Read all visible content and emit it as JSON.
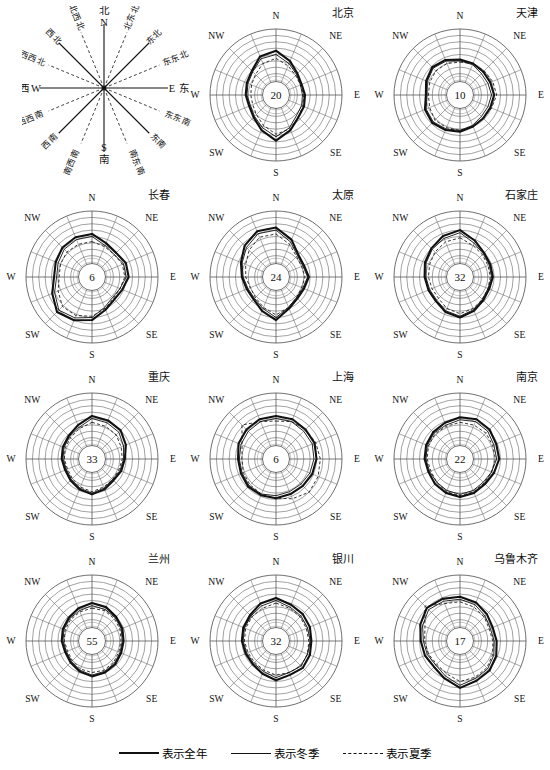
{
  "compass_key": {
    "name": "wind-direction-compass-key",
    "cardinals": [
      {
        "id": "N",
        "latin": "N",
        "cn": "北"
      },
      {
        "id": "E",
        "latin": "E",
        "cn": "东"
      },
      {
        "id": "S",
        "latin": "S",
        "cn": "南"
      },
      {
        "id": "W",
        "latin": "W",
        "cn": "西"
      }
    ],
    "intercardinals": [
      {
        "id": "NNE",
        "cn": "北东北",
        "angle": 22.5
      },
      {
        "id": "NE",
        "cn": "东北",
        "angle": 45
      },
      {
        "id": "ENE",
        "cn": "东东北",
        "angle": 67.5
      },
      {
        "id": "ESE",
        "cn": "东东南",
        "angle": 112.5
      },
      {
        "id": "SE",
        "cn": "东南",
        "angle": 135
      },
      {
        "id": "SSE",
        "cn": "南东南",
        "angle": 157.5
      },
      {
        "id": "SSW",
        "cn": "南西南",
        "angle": 202.5
      },
      {
        "id": "SW",
        "cn": "西南",
        "angle": 225
      },
      {
        "id": "WSW",
        "cn": "西西南",
        "angle": 247.5
      },
      {
        "id": "WNW",
        "cn": "西西北",
        "angle": 292.5
      },
      {
        "id": "NW",
        "cn": "西北",
        "angle": 315
      },
      {
        "id": "NNW",
        "cn": "北西北",
        "angle": 337.5
      }
    ]
  },
  "legend": {
    "items": [
      {
        "id": "annual",
        "style": "thick-solid",
        "label": "表示全年"
      },
      {
        "id": "winter",
        "style": "thin-solid",
        "label": "表示冬季"
      },
      {
        "id": "summer",
        "style": "dashed",
        "label": "表示夏季"
      }
    ]
  },
  "axis_labels": {
    "n": "N",
    "ne": "NE",
    "e": "E",
    "se": "SE",
    "s": "S",
    "sw": "SW",
    "w": "W",
    "nw": "NW"
  },
  "chart_data": {
    "type": "line",
    "subtype": "wind-rose (polar radar), 16 compass sectors",
    "grid": true,
    "rings": 8,
    "sectors": 16,
    "directions": [
      "N",
      "NNE",
      "NE",
      "ENE",
      "E",
      "ESE",
      "SE",
      "SSE",
      "S",
      "SSW",
      "SW",
      "WSW",
      "W",
      "WNW",
      "NW",
      "NNW"
    ],
    "series_legend": [
      {
        "name": "表示全年",
        "style": "thick-solid"
      },
      {
        "name": "表示冬季",
        "style": "thin-solid"
      },
      {
        "name": "表示夏季",
        "style": "dashed"
      }
    ],
    "center_label_meaning": "中心数字为全年静风频率 (%)",
    "rlim": [
      0,
      8
    ],
    "charts": [
      {
        "city_cn": "北京",
        "center_value": "20",
        "series": [
          {
            "name": "表示全年",
            "style": "thick-solid",
            "values": [
              4.6,
              3.4,
              2.4,
              2.0,
              2.2,
              2.4,
              2.6,
              3.6,
              4.8,
              3.6,
              2.6,
              2.2,
              2.4,
              2.6,
              3.0,
              4.2
            ]
          },
          {
            "name": "表示冬季",
            "style": "thin-solid",
            "values": [
              4.0,
              3.0,
              2.2,
              1.8,
              1.8,
              2.0,
              2.2,
              3.2,
              4.2,
              3.2,
              2.4,
              2.0,
              2.2,
              2.4,
              2.8,
              3.8
            ]
          },
          {
            "name": "表示夏季",
            "style": "dashed",
            "values": [
              3.4,
              2.6,
              2.0,
              1.8,
              2.0,
              2.2,
              2.6,
              3.4,
              3.8,
              2.8,
              2.0,
              1.6,
              1.6,
              1.8,
              2.2,
              3.0
            ]
          }
        ]
      },
      {
        "city_cn": "天津",
        "center_value": "10",
        "series": [
          {
            "name": "表示全年",
            "style": "thick-solid",
            "values": [
              3.2,
              3.0,
              2.8,
              2.8,
              3.0,
              2.8,
              2.8,
              3.0,
              3.4,
              3.6,
              3.8,
              3.6,
              3.0,
              3.4,
              3.8,
              3.6
            ]
          },
          {
            "name": "表示冬季",
            "style": "thin-solid",
            "values": [
              3.0,
              2.8,
              2.4,
              2.4,
              2.6,
              2.4,
              2.4,
              2.8,
              3.2,
              3.4,
              3.6,
              3.4,
              2.8,
              3.2,
              3.6,
              3.4
            ]
          },
          {
            "name": "表示夏季",
            "style": "dashed",
            "values": [
              2.8,
              3.0,
              3.0,
              3.2,
              3.4,
              3.0,
              2.8,
              3.0,
              3.2,
              3.2,
              3.2,
              2.8,
              2.6,
              2.8,
              3.0,
              3.0
            ]
          }
        ]
      },
      {
        "city_cn": "长春",
        "center_value": "6",
        "series": [
          {
            "name": "表示全年",
            "style": "thick-solid",
            "values": [
              4.4,
              3.4,
              3.0,
              3.4,
              3.4,
              2.8,
              2.6,
              3.2,
              4.4,
              5.0,
              5.4,
              4.4,
              3.6,
              3.8,
              4.2,
              4.4
            ]
          },
          {
            "name": "表示冬季",
            "style": "thin-solid",
            "values": [
              4.0,
              3.0,
              2.6,
              3.0,
              3.0,
              2.4,
              2.2,
              2.8,
              4.0,
              4.6,
              5.0,
              4.0,
              3.2,
              3.4,
              3.8,
              4.0
            ]
          },
          {
            "name": "表示夏季",
            "style": "dashed",
            "values": [
              3.2,
              2.8,
              2.6,
              2.8,
              2.8,
              2.4,
              2.4,
              3.0,
              3.8,
              4.2,
              4.2,
              3.4,
              2.8,
              3.0,
              3.2,
              3.2
            ]
          }
        ]
      },
      {
        "city_cn": "太原",
        "center_value": "24",
        "series": [
          {
            "name": "表示全年",
            "style": "thick-solid",
            "values": [
              5.4,
              4.0,
              2.6,
              2.4,
              2.8,
              2.4,
              2.4,
              3.0,
              4.4,
              3.4,
              2.6,
              2.6,
              3.0,
              3.6,
              4.6,
              5.4
            ]
          },
          {
            "name": "表示冬季",
            "style": "thin-solid",
            "values": [
              5.0,
              3.6,
              2.4,
              2.2,
              2.6,
              2.2,
              2.2,
              2.8,
              4.0,
              3.0,
              2.4,
              2.4,
              2.8,
              3.4,
              4.2,
              5.0
            ]
          },
          {
            "name": "表示夏季",
            "style": "dashed",
            "values": [
              4.4,
              3.2,
              2.2,
              2.0,
              2.2,
              2.0,
              2.2,
              2.8,
              3.6,
              2.8,
              2.2,
              2.0,
              2.4,
              2.8,
              3.6,
              4.4
            ]
          }
        ]
      },
      {
        "city_cn": "石家庄",
        "center_value": "32",
        "series": [
          {
            "name": "表示全年",
            "style": "thick-solid",
            "values": [
              5.0,
              3.8,
              3.0,
              2.8,
              2.8,
              2.6,
              2.8,
              3.4,
              4.0,
              3.6,
              3.0,
              3.0,
              3.2,
              3.6,
              4.0,
              4.6
            ]
          },
          {
            "name": "表示冬季",
            "style": "thin-solid",
            "values": [
              4.6,
              3.4,
              2.8,
              2.6,
              2.6,
              2.4,
              2.6,
              3.2,
              3.8,
              3.4,
              2.8,
              2.8,
              3.0,
              3.4,
              3.8,
              4.2
            ]
          },
          {
            "name": "表示夏季",
            "style": "dashed",
            "values": [
              3.8,
              3.0,
              2.6,
              2.4,
              2.4,
              2.4,
              2.6,
              3.0,
              3.4,
              3.0,
              2.4,
              2.4,
              2.6,
              2.8,
              3.2,
              3.6
            ]
          }
        ]
      },
      {
        "city_cn": "重庆",
        "center_value": "33",
        "series": [
          {
            "name": "表示全年",
            "style": "thick-solid",
            "values": [
              4.4,
              4.2,
              4.0,
              3.4,
              2.8,
              2.6,
              2.4,
              2.8,
              3.2,
              2.8,
              2.4,
              2.2,
              2.4,
              2.6,
              2.8,
              3.4
            ]
          },
          {
            "name": "表示冬季",
            "style": "thin-solid",
            "values": [
              4.0,
              3.8,
              3.6,
              3.0,
              2.6,
              2.4,
              2.2,
              2.6,
              3.0,
              2.6,
              2.2,
              2.0,
              2.2,
              2.4,
              2.6,
              3.0
            ]
          },
          {
            "name": "表示夏季",
            "style": "dashed",
            "values": [
              3.4,
              3.2,
              3.0,
              2.6,
              2.4,
              2.2,
              2.2,
              2.4,
              2.8,
              2.4,
              2.0,
              1.8,
              2.0,
              2.2,
              2.4,
              2.8
            ]
          }
        ]
      },
      {
        "city_cn": "上海",
        "center_value": "6",
        "series": [
          {
            "name": "表示全年",
            "style": "thick-solid",
            "values": [
              4.4,
              4.4,
              4.2,
              4.2,
              4.0,
              3.8,
              3.6,
              3.6,
              3.8,
              3.8,
              3.8,
              3.6,
              3.6,
              4.0,
              4.2,
              4.4
            ]
          },
          {
            "name": "表示冬季",
            "style": "thin-solid",
            "values": [
              4.0,
              4.0,
              3.8,
              3.8,
              3.6,
              3.4,
              3.2,
              3.2,
              3.4,
              3.6,
              3.6,
              3.4,
              3.4,
              3.6,
              3.8,
              4.0
            ]
          },
          {
            "name": "表示夏季",
            "style": "dashed",
            "values": [
              3.6,
              4.0,
              4.2,
              4.4,
              4.6,
              4.8,
              5.0,
              4.4,
              3.8,
              3.6,
              3.4,
              3.2,
              3.0,
              3.4,
              5.2,
              4.0
            ]
          }
        ]
      },
      {
        "city_cn": "南京",
        "center_value": "22",
        "series": [
          {
            "name": "表示全年",
            "style": "thick-solid",
            "values": [
              4.2,
              4.4,
              4.2,
              3.8,
              3.8,
              3.4,
              3.2,
              3.4,
              3.6,
              3.4,
              3.2,
              3.0,
              3.2,
              3.4,
              3.6,
              3.8
            ]
          },
          {
            "name": "表示冬季",
            "style": "thin-solid",
            "values": [
              3.8,
              4.0,
              3.8,
              3.4,
              3.4,
              3.0,
              2.8,
              3.0,
              3.2,
              3.0,
              2.8,
              2.8,
              3.0,
              3.2,
              3.4,
              3.4
            ]
          },
          {
            "name": "表示夏季",
            "style": "dashed",
            "values": [
              3.4,
              3.4,
              3.4,
              3.2,
              3.2,
              3.0,
              3.0,
              3.2,
              3.4,
              3.2,
              2.8,
              2.6,
              2.8,
              3.0,
              3.2,
              3.2
            ]
          }
        ]
      },
      {
        "city_cn": "兰州",
        "center_value": "55",
        "series": [
          {
            "name": "表示全年",
            "style": "thick-solid",
            "values": [
              3.6,
              3.4,
              3.0,
              2.8,
              2.6,
              2.6,
              2.8,
              3.0,
              3.2,
              2.8,
              2.4,
              2.2,
              2.4,
              2.6,
              2.8,
              3.2
            ]
          },
          {
            "name": "表示冬季",
            "style": "thin-solid",
            "values": [
              3.2,
              3.0,
              2.8,
              2.6,
              2.4,
              2.4,
              2.6,
              2.8,
              3.0,
              2.6,
              2.2,
              2.0,
              2.2,
              2.4,
              2.6,
              2.8
            ]
          },
          {
            "name": "表示夏季",
            "style": "dashed",
            "values": [
              2.8,
              2.8,
              2.6,
              2.4,
              2.2,
              2.2,
              2.4,
              2.6,
              2.6,
              2.4,
              2.0,
              1.8,
              2.0,
              2.2,
              2.4,
              2.6
            ]
          }
        ]
      },
      {
        "city_cn": "银川",
        "center_value": "32",
        "series": [
          {
            "name": "表示全年",
            "style": "thick-solid",
            "values": [
              4.4,
              3.8,
              3.6,
              3.4,
              3.2,
              3.4,
              3.6,
              3.4,
              3.8,
              3.2,
              2.8,
              2.8,
              3.0,
              3.2,
              3.4,
              4.0
            ]
          },
          {
            "name": "表示冬季",
            "style": "thin-solid",
            "values": [
              4.0,
              3.4,
              3.2,
              3.0,
              3.0,
              3.0,
              3.2,
              3.0,
              3.4,
              2.8,
              2.6,
              2.6,
              2.8,
              3.0,
              3.2,
              3.6
            ]
          },
          {
            "name": "表示夏季",
            "style": "dashed",
            "values": [
              3.6,
              3.2,
              3.0,
              2.8,
              2.8,
              3.0,
              3.2,
              3.0,
              3.0,
              2.6,
              2.4,
              2.4,
              2.6,
              2.8,
              3.0,
              3.2
            ]
          }
        ]
      },
      {
        "city_cn": "乌鲁木齐",
        "center_value": "17",
        "series": [
          {
            "name": "表示全年",
            "style": "thick-solid",
            "values": [
              4.6,
              4.2,
              3.6,
              3.2,
              3.4,
              3.8,
              4.2,
              4.4,
              5.0,
              4.0,
              3.4,
              3.6,
              3.8,
              4.4,
              5.0,
              4.8
            ]
          },
          {
            "name": "表示冬季",
            "style": "thin-solid",
            "values": [
              4.2,
              3.8,
              3.2,
              2.8,
              3.0,
              3.4,
              3.8,
              4.0,
              4.6,
              3.6,
              3.0,
              3.2,
              3.4,
              4.0,
              4.6,
              4.4
            ]
          },
          {
            "name": "表示夏季",
            "style": "dashed",
            "values": [
              3.8,
              3.4,
              3.0,
              2.6,
              2.8,
              3.2,
              3.6,
              3.8,
              4.0,
              3.2,
              2.8,
              3.0,
              3.2,
              3.6,
              5.4,
              4.0
            ]
          }
        ]
      }
    ]
  }
}
